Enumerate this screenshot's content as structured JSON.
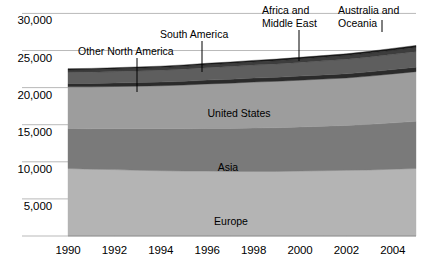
{
  "chart_data": {
    "type": "area",
    "title": "",
    "xlabel": "",
    "ylabel": "",
    "stacked": true,
    "grid": true,
    "legend_position": "inline-annotations",
    "x": [
      1990,
      1991,
      1992,
      1993,
      1994,
      1995,
      1996,
      1997,
      1998,
      1999,
      2000,
      2001,
      2002,
      2003,
      2004,
      2005
    ],
    "xlim": [
      1990,
      2005
    ],
    "ylim": [
      0,
      31000
    ],
    "yticks": [
      5000,
      10000,
      15000,
      20000,
      25000,
      30000
    ],
    "ytick_labels": [
      "5,000",
      "10,000",
      "15,000",
      "20,000",
      "25,000",
      "30,000"
    ],
    "xticks": [
      1990,
      1992,
      1994,
      1996,
      1998,
      2000,
      2002,
      2004
    ],
    "xtick_labels": [
      "1990",
      "1992",
      "1994",
      "1996",
      "1998",
      "2000",
      "2002",
      "2004"
    ],
    "series": [
      {
        "name": "Europe",
        "color": "#b4b4b4",
        "values": [
          9100,
          9000,
          8950,
          8850,
          8800,
          8750,
          8750,
          8700,
          8700,
          8700,
          8750,
          8800,
          8850,
          8900,
          9000,
          9100
        ]
      },
      {
        "name": "Asia",
        "color": "#7a7a7a",
        "values": [
          5400,
          5450,
          5500,
          5600,
          5650,
          5700,
          5750,
          5800,
          5850,
          5900,
          5950,
          6000,
          6050,
          6150,
          6250,
          6350
        ]
      },
      {
        "name": "United States",
        "color": "#9d9d9d",
        "values": [
          5600,
          5650,
          5700,
          5750,
          5800,
          5900,
          6000,
          6100,
          6200,
          6250,
          6300,
          6350,
          6400,
          6500,
          6600,
          6700
        ]
      },
      {
        "name": "South America",
        "color": "#2b2b2b",
        "values": [
          450,
          460,
          470,
          480,
          490,
          500,
          510,
          520,
          530,
          540,
          550,
          560,
          570,
          580,
          590,
          600
        ]
      },
      {
        "name": "Other North America",
        "color": "#5e5e5e",
        "values": [
          1500,
          1520,
          1540,
          1570,
          1600,
          1640,
          1680,
          1720,
          1760,
          1800,
          1850,
          1900,
          1950,
          2000,
          2050,
          2100
        ]
      },
      {
        "name": "Africa and Middle East",
        "color": "#3d3d3d",
        "values": [
          320,
          330,
          340,
          350,
          360,
          375,
          390,
          405,
          420,
          440,
          460,
          480,
          500,
          520,
          545,
          570
        ]
      },
      {
        "name": "Australia and Oceania",
        "color": "#1a1a1a",
        "values": [
          180,
          182,
          185,
          188,
          190,
          195,
          200,
          205,
          210,
          215,
          220,
          228,
          235,
          242,
          250,
          258
        ]
      }
    ],
    "inline_labels": [
      {
        "text": "United States",
        "x_px": 239,
        "y_px": 107
      },
      {
        "text": "Asia",
        "x_px": 228,
        "y_px": 161
      },
      {
        "text": "Europe",
        "x_px": 231,
        "y_px": 215
      }
    ],
    "callouts": [
      {
        "text": "Other North America",
        "label_x_px": 78,
        "label_y_px": 45,
        "line_x_px": 137,
        "line_y1_px": 58,
        "line_y2_px": 92,
        "lines": 1
      },
      {
        "text": "South America",
        "label_x_px": 160,
        "label_y_px": 28,
        "line_x_px": 202,
        "line_y1_px": 41,
        "line_y2_px": 72,
        "lines": 1
      },
      {
        "text": "Africa and Middle East",
        "label_x_px": 262,
        "label_y_px": 4,
        "line_x_px": 299,
        "line_y1_px": 30,
        "line_y2_px": 61,
        "lines": 2
      },
      {
        "text": "Australia and Oceania",
        "label_x_px": 338,
        "label_y_px": 4,
        "line_x_px": 382,
        "line_y1_px": 20,
        "line_y2_px": 32,
        "lines": 2
      }
    ],
    "colors": {
      "gridline": "#b9b9b9",
      "axis": "#8c8c8c",
      "background": "#ffffff",
      "text": "#000000"
    },
    "plot_area_px": {
      "left": 68,
      "right": 416,
      "top": 6,
      "bottom": 236
    }
  }
}
